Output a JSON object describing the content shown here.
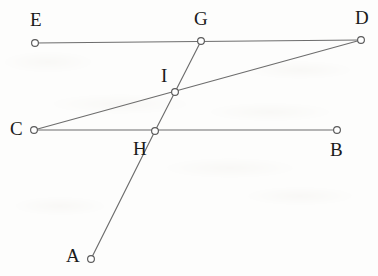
{
  "figure": {
    "type": "geometry-diagram",
    "width": 378,
    "height": 276,
    "background_color": "#fdfdfc",
    "stroke_color": "#6d6d6d",
    "label_color": "#1a1a1a",
    "vertex_fill_color": "#ffffff",
    "points": [
      {
        "id": "E",
        "label": "E",
        "x": 35,
        "y": 43,
        "label_x": 30,
        "label_y": 10
      },
      {
        "id": "G",
        "label": "G",
        "x": 201,
        "y": 41,
        "label_x": 194,
        "label_y": 9
      },
      {
        "id": "D",
        "label": "D",
        "x": 361,
        "y": 40,
        "label_x": 355,
        "label_y": 8
      },
      {
        "id": "I",
        "label": "I",
        "x": 175,
        "y": 92,
        "label_x": 161,
        "label_y": 66
      },
      {
        "id": "C",
        "label": "C",
        "x": 34,
        "y": 130,
        "label_x": 10,
        "label_y": 119
      },
      {
        "id": "H",
        "label": "H",
        "x": 155,
        "y": 131,
        "label_x": 133,
        "label_y": 139
      },
      {
        "id": "B",
        "label": "B",
        "x": 337,
        "y": 130,
        "label_x": 330,
        "label_y": 140
      },
      {
        "id": "A",
        "label": "A",
        "x": 91,
        "y": 259,
        "label_x": 66,
        "label_y": 246
      }
    ],
    "segments": [
      {
        "id": "ED",
        "from": "E",
        "to": "D",
        "passes_through": [
          "G"
        ]
      },
      {
        "id": "CD",
        "from": "C",
        "to": "D",
        "passes_through": [
          "I"
        ]
      },
      {
        "id": "CB",
        "from": "C",
        "to": "B",
        "passes_through": [
          "H"
        ]
      },
      {
        "id": "AG",
        "from": "A",
        "to": "G",
        "passes_through": [
          "H",
          "I"
        ]
      }
    ]
  }
}
